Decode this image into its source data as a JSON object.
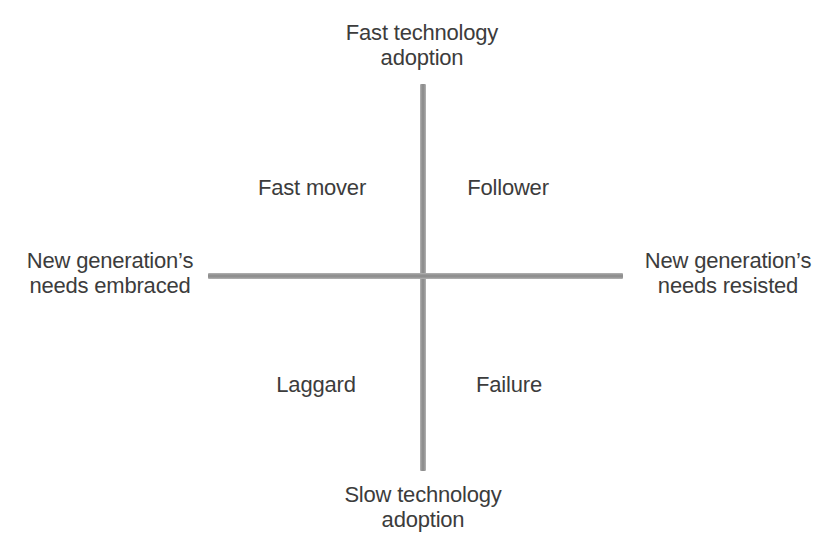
{
  "axes": {
    "top": {
      "label": "Fast technology adoption",
      "lines": [
        "Fast technology",
        "adoption"
      ]
    },
    "bottom": {
      "label": "Slow technology adoption",
      "lines": [
        "Slow technology",
        "adoption"
      ]
    },
    "left": {
      "label": "New generation’s needs embraced",
      "lines": [
        "New generation’s",
        "needs embraced"
      ]
    },
    "right": {
      "label": "New generation’s needs resisted",
      "lines": [
        "New generation’s",
        "needs resisted"
      ]
    }
  },
  "quadrants": [
    {
      "position": "top-left",
      "label": "Fast mover"
    },
    {
      "position": "top-right",
      "label": "Follower"
    },
    {
      "position": "bottom-left",
      "label": "Laggard"
    },
    {
      "position": "bottom-right",
      "label": "Failure"
    }
  ],
  "colors": {
    "background": "#ffffff",
    "axis_line": "#9a9a9a",
    "text": "#3c3c3c"
  }
}
